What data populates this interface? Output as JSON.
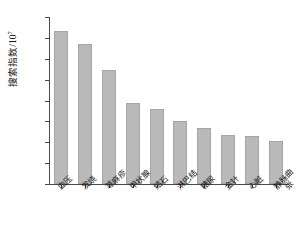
{
  "chart_data": {
    "type": "bar",
    "title": "",
    "xlabel": "",
    "ylabel": "搜索指数/10",
    "ylabel_exponent": "7",
    "ylim": [
      0.0,
      4.0
    ],
    "ytick_labels": [
      "0.0",
      "0.5",
      "1.0",
      "1.5",
      "2.0",
      "2.5",
      "3.0",
      "3.5",
      "4.0"
    ],
    "ytick_values": [
      0.0,
      0.5,
      1.0,
      1.5,
      2.0,
      2.5,
      3.0,
      3.5,
      4.0
    ],
    "grid": false,
    "legend": false,
    "bar_color": "#b9b9b9",
    "bar_edge_color": "#a6a6a6",
    "axis_color": "#4a4a4a",
    "categories": [
      "血压",
      "发烧",
      "荨麻疹",
      "甲状腺",
      "结石",
      "淋巴结",
      "糖尿",
      "金针",
      "心脏",
      "静脉曲张"
    ],
    "values": [
      3.66,
      3.35,
      2.73,
      1.93,
      1.8,
      1.51,
      1.34,
      1.17,
      1.15,
      1.03
    ]
  }
}
